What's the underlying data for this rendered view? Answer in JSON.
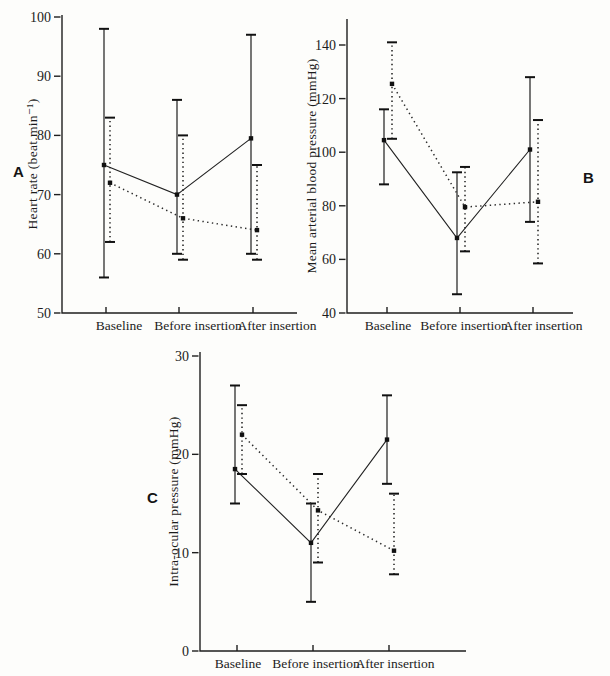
{
  "figure": {
    "background": "#fdfdfb",
    "ink": "#1e1e1e"
  },
  "chart_data": [
    {
      "panel": "A",
      "type": "line",
      "error_bars": true,
      "title": "",
      "xlabel": "",
      "ylabel": "Heart rate (beat.min⁻¹)",
      "categories": [
        "Baseline",
        "Before insertion",
        "After insertion"
      ],
      "ylim": [
        50,
        100
      ],
      "yticks": [
        50,
        60,
        70,
        80,
        90,
        100
      ],
      "grid": false,
      "legend": "none",
      "series": [
        {
          "name": "solid-line-group",
          "style": "solid",
          "values": [
            75,
            70,
            79.5
          ],
          "err_low": [
            56,
            60,
            60
          ],
          "err_high": [
            98,
            86,
            97
          ]
        },
        {
          "name": "dotted-line-group",
          "style": "dotted",
          "values": [
            72,
            66,
            64
          ],
          "err_low": [
            62,
            59,
            59
          ],
          "err_high": [
            83,
            80,
            75
          ]
        }
      ]
    },
    {
      "panel": "B",
      "type": "line",
      "error_bars": true,
      "title": "",
      "xlabel": "",
      "ylabel": "Mean arterial blood pressure (mmHg)",
      "categories": [
        "Baseline",
        "Before insertion",
        "After insertion"
      ],
      "ylim": [
        40,
        140
      ],
      "yticks": [
        40,
        60,
        80,
        100,
        120,
        140
      ],
      "grid": false,
      "legend": "none",
      "series": [
        {
          "name": "solid-line-group",
          "style": "solid",
          "values": [
            104.5,
            68,
            101
          ],
          "err_low": [
            88,
            47,
            74
          ],
          "err_high": [
            116,
            92.5,
            128
          ]
        },
        {
          "name": "dotted-line-group",
          "style": "dotted",
          "values": [
            125.5,
            79.5,
            81.5
          ],
          "err_low": [
            105,
            63,
            58.5
          ],
          "err_high": [
            141,
            94.5,
            112
          ]
        }
      ]
    },
    {
      "panel": "C",
      "type": "line",
      "error_bars": true,
      "title": "",
      "xlabel": "",
      "ylabel": "Intra-ocular pressure (mmHg)",
      "categories": [
        "Baseline",
        "Before insertion",
        "After insertion"
      ],
      "ylim": [
        0,
        30
      ],
      "yticks": [
        0,
        10,
        20,
        30
      ],
      "grid": false,
      "legend": "none",
      "series": [
        {
          "name": "solid-line-group",
          "style": "solid",
          "values": [
            18.5,
            11,
            21.5
          ],
          "err_low": [
            15,
            5,
            17
          ],
          "err_high": [
            27,
            15,
            26
          ]
        },
        {
          "name": "dotted-line-group",
          "style": "dotted",
          "values": [
            22,
            14.3,
            10.2
          ],
          "err_low": [
            18,
            9,
            7.8
          ],
          "err_high": [
            25,
            18,
            16
          ]
        }
      ]
    }
  ]
}
